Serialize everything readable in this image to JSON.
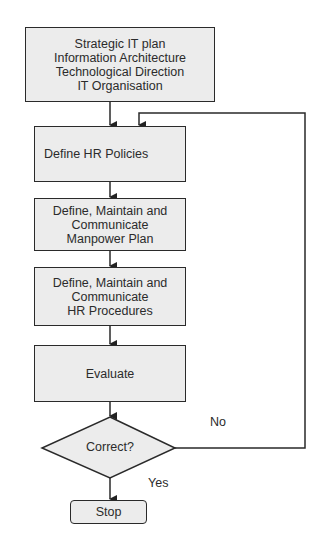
{
  "diagram": {
    "type": "flowchart",
    "nodes": [
      {
        "id": "start",
        "shape": "rect",
        "lines": "Strategic IT plan\nInformation Architecture\nTechnological Direction\nIT Organisation"
      },
      {
        "id": "policies",
        "shape": "rect",
        "lines": "Define HR Policies"
      },
      {
        "id": "manpower",
        "shape": "rect",
        "lines": "Define, Maintain and\nCommunicate\nManpower Plan"
      },
      {
        "id": "procedures",
        "shape": "rect",
        "lines": "Define, Maintain and\nCommunicate\nHR Procedures"
      },
      {
        "id": "evaluate",
        "shape": "rect",
        "lines": "Evaluate"
      },
      {
        "id": "decision",
        "shape": "diamond",
        "lines": "Correct?"
      },
      {
        "id": "stop",
        "shape": "rounded-rect",
        "lines": "Stop"
      }
    ],
    "edges": [
      {
        "from": "start",
        "to": "policies"
      },
      {
        "from": "policies",
        "to": "manpower"
      },
      {
        "from": "manpower",
        "to": "procedures"
      },
      {
        "from": "procedures",
        "to": "evaluate"
      },
      {
        "from": "evaluate",
        "to": "decision"
      },
      {
        "from": "decision",
        "to": "stop",
        "label": "Yes"
      },
      {
        "from": "decision",
        "to": "policies",
        "label": "No"
      }
    ],
    "labels": {
      "yes": "Yes",
      "no": "No"
    },
    "colors": {
      "box_fill": "#ececec",
      "stroke": "#2a2a2a",
      "text": "#2b2b2b"
    }
  }
}
